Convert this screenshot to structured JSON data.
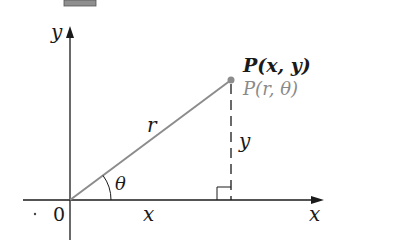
{
  "diagram": {
    "type": "polar-cartesian-relationship",
    "labels": {
      "y_axis": "y",
      "x_axis": "x",
      "origin": "0",
      "point_cartesian": "P(x, y)",
      "point_polar": "P(r, θ)",
      "radius": "r",
      "angle": "θ",
      "horizontal_leg": "x",
      "vertical_leg": "y"
    },
    "colors": {
      "axis": "#1a1a1a",
      "radius_line": "#8c8c8c",
      "point": "#8c8c8c",
      "polar_label": "#8a8a8a",
      "header_box": "#8f8f8f"
    }
  }
}
